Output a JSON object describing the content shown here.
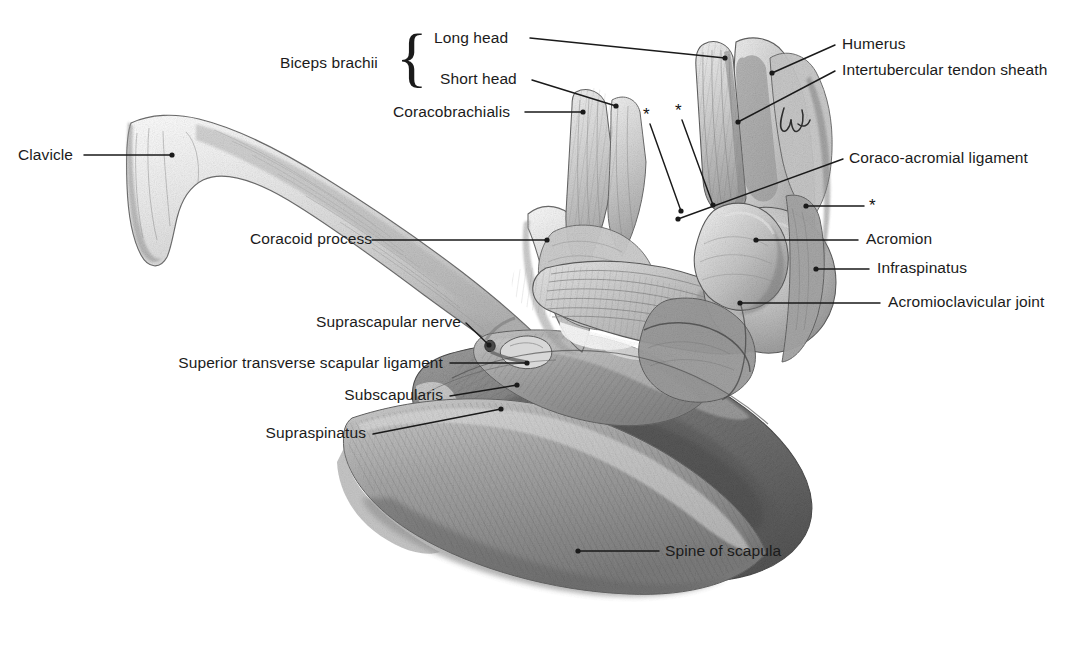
{
  "figure": {
    "kind": "anatomical-illustration",
    "medium": "pencil drawing, grayscale",
    "width": 1079,
    "height": 670,
    "background_color": "#ffffff",
    "label_color": "#1b1b1b",
    "leader_color": "#1a1a1a"
  },
  "bracket": {
    "label": "Biceps brachii",
    "glyph": "{",
    "groups": [
      "Long head",
      "Short head"
    ]
  },
  "labels": [
    {
      "id": "long-head",
      "text": "Long head",
      "align": "left",
      "x": 434,
      "y": 30,
      "leader": [
        [
          530,
          38
        ],
        [
          725,
          58
        ]
      ]
    },
    {
      "id": "humerus",
      "text": "Humerus",
      "align": "left",
      "x": 842,
      "y": 36,
      "leader": [
        [
          835,
          45
        ],
        [
          772,
          73
        ]
      ]
    },
    {
      "id": "intertubercular",
      "text": "Intertubercular tendon sheath",
      "align": "left",
      "x": 842,
      "y": 62,
      "leader": [
        [
          835,
          71
        ],
        [
          738,
          122
        ]
      ]
    },
    {
      "id": "short-head",
      "text": "Short head",
      "align": "left",
      "x": 440,
      "y": 71,
      "leader": [
        [
          532,
          80
        ],
        [
          616,
          106
        ]
      ]
    },
    {
      "id": "coracobrachialis",
      "text": "Coracobrachialis",
      "align": "left",
      "x": 393,
      "y": 104,
      "leader": [
        [
          525,
          112
        ],
        [
          583,
          112
        ]
      ]
    },
    {
      "id": "clavicle",
      "text": "Clavicle",
      "align": "left",
      "x": 18,
      "y": 147,
      "leader": [
        [
          84,
          155
        ],
        [
          172,
          155
        ]
      ]
    },
    {
      "id": "coraco-acromial",
      "text": "Coraco-acromial ligament",
      "align": "left",
      "x": 849,
      "y": 150,
      "leader": [
        [
          843,
          159
        ],
        [
          678,
          219
        ]
      ]
    },
    {
      "id": "coracoid-process",
      "text": "Coracoid process",
      "align": "left",
      "x": 250,
      "y": 231,
      "leader": [
        [
          372,
          240
        ],
        [
          547,
          240
        ]
      ]
    },
    {
      "id": "acromion",
      "text": "Acromion",
      "align": "left",
      "x": 866,
      "y": 231,
      "leader": [
        [
          858,
          240
        ],
        [
          756,
          240
        ]
      ]
    },
    {
      "id": "infraspinatus",
      "text": "Infraspinatus",
      "align": "left",
      "x": 877,
      "y": 260,
      "leader": [
        [
          869,
          269
        ],
        [
          816,
          269
        ]
      ]
    },
    {
      "id": "acj",
      "text": "Acromioclavicular joint",
      "align": "left",
      "x": 888,
      "y": 294,
      "leader": [
        [
          880,
          303
        ],
        [
          740,
          303
        ]
      ]
    },
    {
      "id": "suprascapular-nerve",
      "text": "Suprascapular nerve",
      "align": "right",
      "x": 461,
      "y": 314,
      "leader": [
        [
          466,
          323
        ],
        [
          488,
          346
        ]
      ]
    },
    {
      "id": "sts-ligament",
      "text": "Superior transverse scapular ligament",
      "align": "right",
      "x": 443,
      "y": 355,
      "leader": [
        [
          450,
          363
        ],
        [
          527,
          363
        ]
      ]
    },
    {
      "id": "subscapularis",
      "text": "Subscapularis",
      "align": "right",
      "x": 443,
      "y": 387,
      "leader": [
        [
          450,
          396
        ],
        [
          517,
          385
        ]
      ]
    },
    {
      "id": "supraspinatus",
      "text": "Supraspinatus",
      "align": "right",
      "x": 366,
      "y": 425,
      "leader": [
        [
          373,
          434
        ],
        [
          501,
          409
        ]
      ]
    },
    {
      "id": "spine-of-scapula",
      "text": "Spine of scapula",
      "align": "left",
      "x": 665,
      "y": 543,
      "leader": [
        [
          659,
          551
        ],
        [
          578,
          551
        ]
      ]
    }
  ],
  "asterisks": [
    {
      "id": "asterisk-1",
      "glyph": "*",
      "x": 643,
      "y": 106,
      "leader": [
        [
          650,
          124
        ],
        [
          680,
          211
        ]
      ]
    },
    {
      "id": "asterisk-2",
      "glyph": "*",
      "x": 675,
      "y": 102,
      "leader": [
        [
          682,
          120
        ],
        [
          712,
          205
        ]
      ]
    },
    {
      "id": "asterisk-3",
      "glyph": "*",
      "x": 869,
      "y": 197,
      "leader": [
        [
          864,
          206
        ],
        [
          806,
          206
        ]
      ]
    }
  ],
  "structures": [
    {
      "name": "clavicle",
      "note": "long S-curved bone, light gray, upper left"
    },
    {
      "name": "coracoid-process",
      "note": "pale bony process, mid-figure"
    },
    {
      "name": "humerus-head",
      "note": "proximal humerus, upper right"
    },
    {
      "name": "acromion",
      "note": "rounded process, right of center"
    },
    {
      "name": "scapula-body",
      "note": "large dark fan-shaped mass, lower right"
    },
    {
      "name": "spine-of-scapula",
      "note": "ridge along lower border"
    },
    {
      "name": "coraco-acromial-ligament",
      "note": "striated fan of fibres across centre"
    },
    {
      "name": "biceps-long-head-tendon",
      "note": "vertical striated tendon, top centre-right"
    },
    {
      "name": "biceps-short-head-coracobrachialis",
      "note": "paired bellies ascending from coracoid"
    }
  ]
}
